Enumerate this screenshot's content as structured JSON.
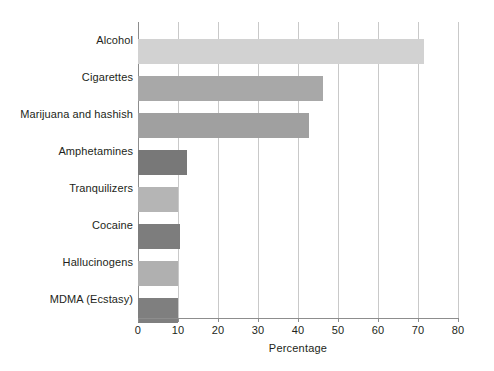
{
  "chart_data": {
    "type": "bar",
    "orientation": "horizontal",
    "title": "",
    "xlabel": "Percentage",
    "ylabel": "",
    "xlim": [
      0,
      80
    ],
    "xticks": [
      0,
      10,
      20,
      30,
      40,
      50,
      60,
      70,
      80
    ],
    "grid": "vertical gridlines at every x tick",
    "legend": "none",
    "categories": [
      "Alcohol",
      "Cigarettes",
      "Marijuana and hashish",
      "Amphetamines",
      "Tranquilizers",
      "Cocaine",
      "Hallucinogens",
      "MDMA (Ecstasy)"
    ],
    "values": [
      71.5,
      46.3,
      42.8,
      12.3,
      10.0,
      10.5,
      10.0,
      10.0
    ],
    "bar_colors": [
      "#d2d2d2",
      "#a8a8a8",
      "#a0a0a0",
      "#787878",
      "#b5b5b5",
      "#7d7d7d",
      "#b0b0b0",
      "#7f7f7f"
    ]
  },
  "axis": {
    "tick_labels": [
      "0",
      "10",
      "20",
      "30",
      "40",
      "50",
      "60",
      "70",
      "80"
    ],
    "x_axis_title": "Percentage"
  }
}
